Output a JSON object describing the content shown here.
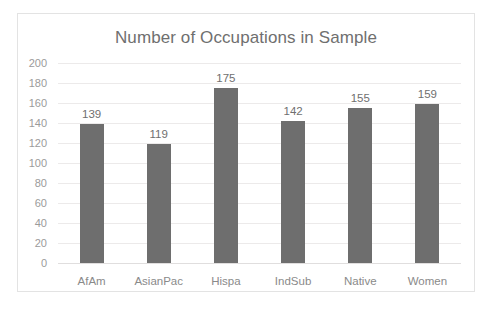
{
  "chart_data": {
    "type": "bar",
    "title": "Number of Occupations in Sample",
    "xlabel": "",
    "ylabel": "",
    "categories": [
      "AfAm",
      "AsianPac",
      "Hispa",
      "IndSub",
      "Native",
      "Women"
    ],
    "values": [
      139,
      119,
      175,
      142,
      155,
      159
    ],
    "data_labels": [
      "139",
      "119",
      "175",
      "142",
      "155",
      "159"
    ],
    "ylim": [
      0,
      200
    ],
    "ytick_step": 20,
    "yticks": [
      "200",
      "180",
      "160",
      "140",
      "120",
      "100",
      "80",
      "60",
      "40",
      "20",
      "0"
    ],
    "ytick_values": [
      200,
      180,
      160,
      140,
      120,
      100,
      80,
      60,
      40,
      20,
      0
    ],
    "grid": true,
    "legend": false,
    "legend_position": "none",
    "bar_color": "#6e6e6e",
    "gridline_color": "#eceaea",
    "text_color": "#6f6f6f",
    "axis_text_color": "#9b9b9b",
    "frame_color": "#e3e3e3",
    "background_color": "#ffffff"
  }
}
